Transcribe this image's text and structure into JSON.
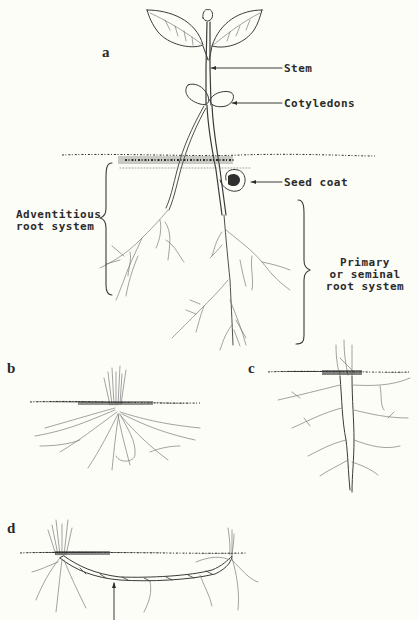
{
  "figure": {
    "panels": [
      {
        "id": "a",
        "label": "a"
      },
      {
        "id": "b",
        "label": "b"
      },
      {
        "id": "c",
        "label": "c"
      },
      {
        "id": "d",
        "label": "d"
      }
    ],
    "annotations": {
      "stem": "Stem",
      "cotyledons": "Cotyledons",
      "seed_coat": "Seed coat",
      "adventitious_line1": "Adventitious",
      "adventitious_line2": "root system",
      "primary_line1": "Primary",
      "primary_line2": "or seminal",
      "primary_line3": "root system"
    },
    "colors": {
      "background": "#fdfdf8",
      "ink": "#3a3a3a",
      "soil": "#2e2e2e"
    }
  }
}
